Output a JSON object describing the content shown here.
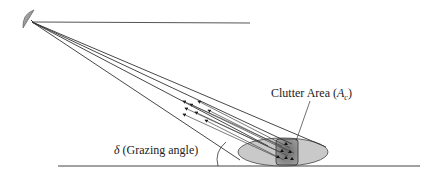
{
  "diagram": {
    "labels": {
      "clutter_area": "Clutter Area",
      "clutter_symbol": "A",
      "clutter_subscript": "c",
      "grazing_symbol": "δ",
      "grazing_text": "(Grazing angle)"
    },
    "elements": {
      "antenna": "radar-dish",
      "beam": "radar-beam-cone",
      "ground": "ground-line",
      "footprint": "illuminated-ellipse",
      "cell": "clutter-cell",
      "angle_arc": "grazing-angle-arc"
    },
    "colors": {
      "line": "#3a3a3a",
      "ellipse_fill": "#c8c8c8",
      "cell_fill": "#8a8a8a",
      "dish": "#909090"
    }
  }
}
